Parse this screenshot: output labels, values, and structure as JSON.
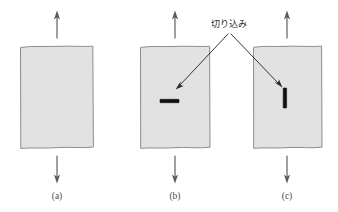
{
  "figure": {
    "background_color": "#ffffff",
    "sheet_fill_color": "#e2e2e2",
    "sheet_stroke_color": "#8d8d8d",
    "notch_color": "#111111",
    "arrow_color": "#5a5a5a",
    "leader_color": "#2a2a2a",
    "annotation": {
      "label": "切り込み",
      "label_x": 229,
      "label_y": 27,
      "apex_x": 229,
      "apex_y": 33
    },
    "panels": [
      {
        "id": "a",
        "caption": "(a)",
        "caption_x": 57,
        "caption_y": 199,
        "sheet_x": 20,
        "sheet_y": 46,
        "sheet_w": 73,
        "sheet_h": 102,
        "top_arrow_x": 57,
        "top_arrow_y_tail": 38,
        "top_arrow_y_tip": 12,
        "bottom_arrow_x": 57,
        "bottom_arrow_y_tail": 156,
        "bottom_arrow_y_tip": 182,
        "notch": null
      },
      {
        "id": "b",
        "caption": "(b)",
        "caption_x": 175,
        "caption_y": 199,
        "sheet_x": 140,
        "sheet_y": 46,
        "sheet_w": 70,
        "sheet_h": 102,
        "top_arrow_x": 175,
        "top_arrow_y_tail": 38,
        "top_arrow_y_tip": 12,
        "bottom_arrow_x": 175,
        "bottom_arrow_y_tail": 156,
        "bottom_arrow_y_tip": 182,
        "notch": {
          "orientation": "horizontal",
          "x": 160,
          "y": 99,
          "length": 19,
          "thickness": 3.4
        },
        "leader_tip_x": 176,
        "leader_tip_y": 88
      },
      {
        "id": "c",
        "caption": "(c)",
        "caption_x": 287,
        "caption_y": 199,
        "sheet_x": 253,
        "sheet_y": 46,
        "sheet_w": 69,
        "sheet_h": 102,
        "top_arrow_x": 287,
        "top_arrow_y_tail": 38,
        "top_arrow_y_tip": 12,
        "bottom_arrow_x": 287,
        "bottom_arrow_y_tail": 156,
        "bottom_arrow_y_tip": 182,
        "notch": {
          "orientation": "vertical",
          "x": 283,
          "y": 88,
          "length": 20,
          "thickness": 3.4
        },
        "leader_tip_x": 281,
        "leader_tip_y": 86
      }
    ]
  }
}
